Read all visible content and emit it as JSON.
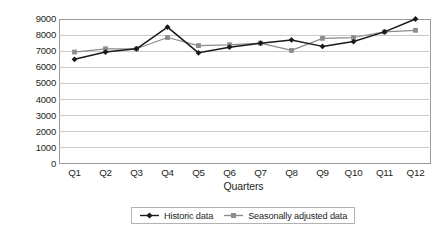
{
  "chart_data": {
    "type": "line",
    "title": "",
    "xlabel": "Quarters",
    "ylabel": "Sales volumes",
    "categories": [
      "Q1",
      "Q2",
      "Q3",
      "Q4",
      "Q5",
      "Q6",
      "Q7",
      "Q8",
      "Q9",
      "Q10",
      "Q11",
      "Q12"
    ],
    "ylim": [
      0,
      9000
    ],
    "ytick_labels": [
      "9000",
      "8000",
      "7000",
      "6000",
      "5000",
      "4000",
      "3000",
      "2000",
      "1000",
      "0"
    ],
    "ytick_values": [
      9000,
      8000,
      7000,
      6000,
      5000,
      4000,
      3000,
      2000,
      1000,
      0
    ],
    "grid": "horizontal",
    "legend_position": "bottom",
    "series": [
      {
        "name": "Historic data",
        "color": "#1a1a1a",
        "marker": "diamond",
        "values": [
          6500,
          6950,
          7150,
          8500,
          6900,
          7250,
          7500,
          7700,
          7300,
          7600,
          8200,
          9000
        ]
      },
      {
        "name": "Seasonally adjusted data",
        "color": "#8c8c8c",
        "marker": "square",
        "values": [
          6950,
          7150,
          7150,
          7850,
          7350,
          7400,
          7500,
          7050,
          7800,
          7850,
          8200,
          8300
        ]
      }
    ]
  },
  "colors": {
    "axis": "#9a9a9a",
    "gridline": "#c9c9c9",
    "text": "#231f20",
    "series_historic": "#1a1a1a",
    "series_adjusted": "#8c8c8c",
    "legend_border": "#b3b3b3",
    "background": "#ffffff"
  }
}
